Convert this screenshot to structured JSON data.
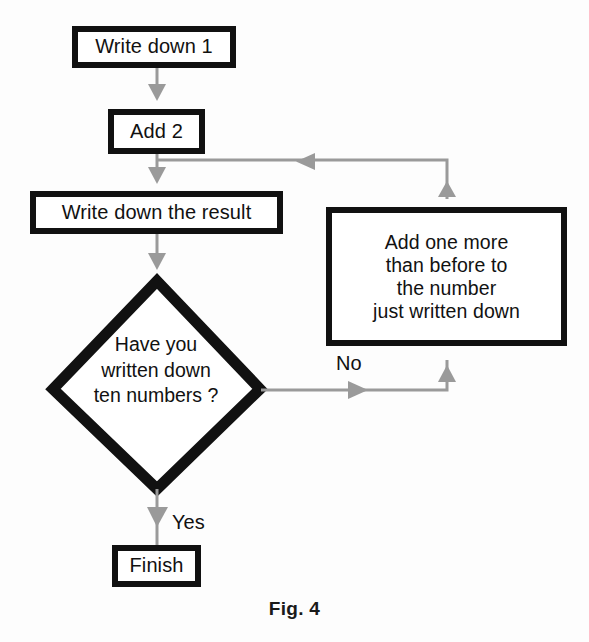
{
  "figure": {
    "caption": "Fig. 4",
    "colors": {
      "node_border": "#111111",
      "node_fill": "#ffffff",
      "connector": "#9a9a9a",
      "text": "#111111",
      "background": "#fdfdfd"
    }
  },
  "nodes": {
    "start": {
      "label": "Write down 1",
      "shape": "rectangle"
    },
    "add2": {
      "label": "Add 2",
      "shape": "rectangle"
    },
    "write_result": {
      "label": "Write down the result",
      "shape": "rectangle"
    },
    "decision": {
      "label": "Have you\nwritten down\nten numbers ?",
      "shape": "diamond"
    },
    "add_more": {
      "label": "Add one more\nthan before to\nthe number\njust written down",
      "shape": "rectangle"
    },
    "finish": {
      "label": "Finish",
      "shape": "rectangle"
    }
  },
  "edges": {
    "start_to_add2": {
      "label": ""
    },
    "add2_to_write_result": {
      "label": ""
    },
    "write_result_to_decision": {
      "label": ""
    },
    "decision_no": {
      "label": "No"
    },
    "decision_yes": {
      "label": "Yes"
    },
    "add_more_to_add2_loop": {
      "label": ""
    }
  }
}
